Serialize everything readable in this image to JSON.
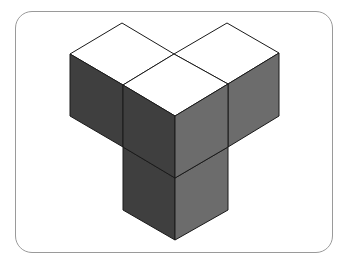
{
  "figure": {
    "cube_count": 4,
    "colors": {
      "top_face": "#ffffff",
      "left_face": "#3f3f3f",
      "right_face": "#6c6c6c",
      "edge": "#1a1a1a",
      "frame_border": "#9a9a9a"
    }
  }
}
